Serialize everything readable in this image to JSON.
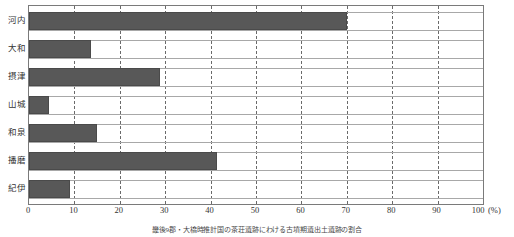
{
  "chart_data": {
    "type": "bar",
    "orientation": "horizontal",
    "title": "",
    "subtitle": "",
    "xlabel": "(%)",
    "ylabel": "",
    "categories": [
      "河内",
      "大和",
      "摂津",
      "山城",
      "和泉",
      "播磨",
      "紀伊"
    ],
    "values": [
      70.0,
      13.7,
      28.8,
      4.3,
      15.0,
      41.5,
      9.0
    ],
    "series": [
      {
        "name": "割合",
        "values": [
          70.0,
          13.7,
          28.8,
          4.3,
          15.0,
          41.5,
          9.0
        ],
        "color": "#585858"
      }
    ],
    "xlim": [
      0,
      100
    ],
    "xticks": [
      0,
      10,
      20,
      30,
      40,
      50,
      60,
      70,
      80,
      90,
      100
    ],
    "xtick_labels": [
      "0",
      "10",
      "20",
      "30",
      "40",
      "50",
      "60",
      "70",
      "80",
      "90",
      "100"
    ],
    "unit_label": "(%)",
    "grid": true,
    "grid_axis": "x",
    "grid_style": "dashed",
    "legend": false,
    "legend_position": "none",
    "bar_color": "#585858",
    "bar_edge_color": "#4a4a4a",
    "frame_color": "#7a7a7a",
    "row_rule_color": "#a8a8a8",
    "background_color": "#ffffff"
  },
  "caption": {
    "text": "畿後9郡・大橋時推計国の茶荘遺跡にわける古墳期遺出土遺跡の割合"
  },
  "axis": {
    "x_unit": "(%)"
  }
}
